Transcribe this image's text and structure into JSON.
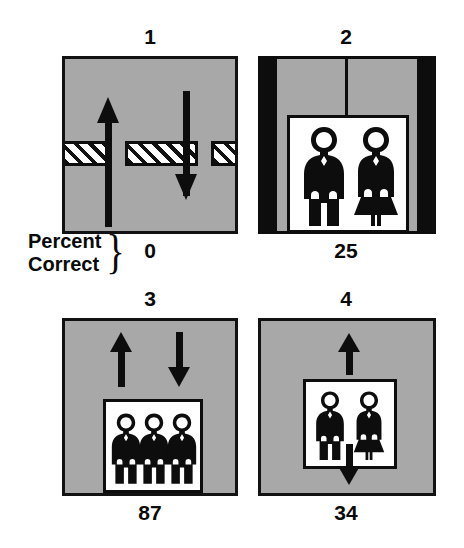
{
  "figure": {
    "axis_caption": {
      "line1": "Percent",
      "line2": "Correct",
      "brace": "}"
    },
    "panels": [
      {
        "number": "1",
        "score": "0",
        "scene": "corridor-with-hatched-band",
        "arrows": [
          "up",
          "down"
        ],
        "occupants": []
      },
      {
        "number": "2",
        "score": "25",
        "scene": "elevator-doorway",
        "arrows": [],
        "occupants": [
          "man",
          "woman"
        ]
      },
      {
        "number": "3",
        "score": "87",
        "scene": "sign-with-arrows-above",
        "arrows": [
          "up",
          "down"
        ],
        "occupants": [
          "man",
          "man",
          "man"
        ]
      },
      {
        "number": "4",
        "score": "34",
        "scene": "sign-with-arrow-above-and-below",
        "arrows": [
          "up",
          "down"
        ],
        "occupants": [
          "man",
          "woman"
        ]
      }
    ]
  },
  "colors": {
    "panel_fill": "#a8a8a8",
    "ink": "#0d0d0d",
    "sign_fill": "#ffffff",
    "page": "#ffffff"
  }
}
